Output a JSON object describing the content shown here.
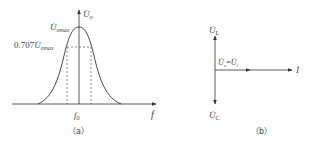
{
  "figure_a": {
    "caption": "（a）",
    "y_axis_label": "U̇",
    "y_axis_sub": "o",
    "x_axis_label": "f",
    "peak_label": "U̇",
    "peak_sub": "omax",
    "half_power_prefix": "0.707",
    "half_power_label": "U̇",
    "half_power_sub": "omax",
    "center_freq_label": "f",
    "center_freq_sub": "0"
  },
  "figure_b": {
    "caption": "（b）",
    "up_label": "U̇",
    "up_sub": "L",
    "down_label": "U̇",
    "down_sub": "C",
    "current_label": "İ",
    "resistor_label_left": "U̇",
    "resistor_label_left_sub": "o",
    "resistor_label_eq": "=",
    "resistor_label_right": "U̇",
    "resistor_label_right_sub": "i"
  },
  "colors": {
    "line": "#444444",
    "dashed": "#555555"
  }
}
